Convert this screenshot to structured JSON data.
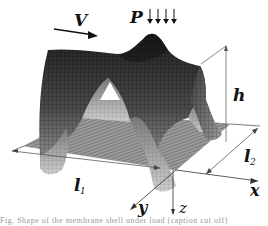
{
  "figure": {
    "labels": {
      "velocity": "V",
      "load": "P",
      "height": "h",
      "length1": "l",
      "length1_sub": "1",
      "length2": "l",
      "length2_sub": "2",
      "axis_x": "x",
      "axis_y": "y",
      "axis_z": "z"
    },
    "load_arrow_count": 4,
    "caption": "Fig. Shape of the membrane shell under load (caption cut off)"
  },
  "colors": {
    "mesh_dark": "#2a2a2a",
    "mesh_mid": "#6a6a6a",
    "mesh_light": "#b8b8b8",
    "base_plane": "#8c8c8c",
    "dimension_line": "#444444"
  }
}
